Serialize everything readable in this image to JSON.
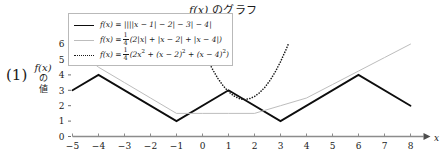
{
  "chart_data": {
    "type": "line",
    "title": "f(x) のグラフ",
    "xlabel": "x",
    "ylabel": "f(x) の値",
    "xlim": [
      -5,
      8
    ],
    "ylim": [
      0,
      6.6
    ],
    "xticks": [
      "-5",
      "-4",
      "-3",
      "-2",
      "-1",
      "0",
      "1",
      "2",
      "3",
      "4",
      "5",
      "6",
      "7",
      "8"
    ],
    "xtick_values": [
      -5,
      -4,
      -3,
      -2,
      -1,
      0,
      1,
      2,
      3,
      4,
      5,
      6,
      7,
      8
    ],
    "yticks": [
      "0",
      "1",
      "2",
      "3",
      "4",
      "5",
      "6"
    ],
    "ytick_values": [
      0,
      1,
      2,
      3,
      4,
      5,
      6
    ],
    "grid": false,
    "legend_position": "upper-left",
    "series": [
      {
        "name": "nested-abs",
        "style": "solid",
        "color": "#0d0d0d",
        "width": 1.8,
        "label_plain": "f(x) = ||||x - 1| - 2| - 3| - 4|",
        "points": [
          [
            -5,
            3
          ],
          [
            -4,
            4
          ],
          [
            -1,
            1
          ],
          [
            1,
            3
          ],
          [
            3,
            1
          ],
          [
            6,
            4
          ],
          [
            8,
            2
          ]
        ]
      },
      {
        "name": "abs-average",
        "style": "solid",
        "color": "#bdbdbd",
        "width": 1.0,
        "label_plain": "f(x) = 1/4 (2|x| + |x - 2| + |x - 4|)",
        "points": [
          [
            -5,
            6
          ],
          [
            -4.75,
            5.5
          ],
          [
            -4,
            4.5
          ],
          [
            -3,
            3.5
          ],
          [
            -2,
            2.5
          ],
          [
            -1,
            1.5
          ],
          [
            0,
            1.5
          ],
          [
            1,
            1.5
          ],
          [
            2,
            1.5
          ],
          [
            3,
            2.0
          ],
          [
            4,
            2.5
          ],
          [
            5,
            3.375
          ],
          [
            6,
            4.25
          ],
          [
            7,
            5.125
          ],
          [
            8,
            6
          ]
        ]
      },
      {
        "name": "quadratic-average",
        "style": "dotted",
        "color": "#1a1a1a",
        "width": 1.6,
        "label_plain": "f(x) = 1/4 (2x^2 + (x - 2)^2 + (x - 4)^2)",
        "points": [
          [
            0.15,
            5.15
          ],
          [
            0.4,
            4.32
          ],
          [
            0.6,
            3.75
          ],
          [
            0.8,
            3.28
          ],
          [
            1.0,
            2.91
          ],
          [
            1.2,
            2.64
          ],
          [
            1.4,
            2.47
          ],
          [
            1.5,
            2.42
          ],
          [
            1.6,
            2.4
          ],
          [
            1.8,
            2.45
          ],
          [
            2.0,
            2.6
          ],
          [
            2.2,
            2.85
          ],
          [
            2.4,
            3.2
          ],
          [
            2.6,
            3.65
          ],
          [
            2.8,
            4.2
          ],
          [
            3.0,
            4.85
          ],
          [
            3.2,
            5.6
          ],
          [
            3.3,
            6.01
          ]
        ]
      }
    ]
  },
  "title": {
    "fx": "f(x)",
    "suffix": " のグラフ"
  },
  "problem": {
    "number": "(1)"
  },
  "axis": {
    "y_label_fx": "f(x)",
    "y_label_line2": "の",
    "y_label_line3": "値",
    "x_letter": "x"
  },
  "legend": {
    "rows": [
      {
        "swatch": "solid-black-line-swatch",
        "lhs": "f(x) =",
        "body": "||||x − 1| − 2| − 3| − 4|"
      },
      {
        "swatch": "solid-gray-line-swatch",
        "lhs": "f(x) =",
        "frac_num": "1",
        "frac_den": "4",
        "body": "(2|x| + |x − 2| + |x − 4|)"
      },
      {
        "swatch": "dotted-black-line-swatch",
        "lhs": "f(x) =",
        "frac_num": "1",
        "frac_den": "4",
        "body_pre": "(2x",
        "body_sup1": "2",
        "body_mid": " + (x − 2)",
        "body_sup2": "2",
        "body_mid2": " + (x − 4)",
        "body_sup3": "2",
        "body_end": ")"
      }
    ]
  }
}
